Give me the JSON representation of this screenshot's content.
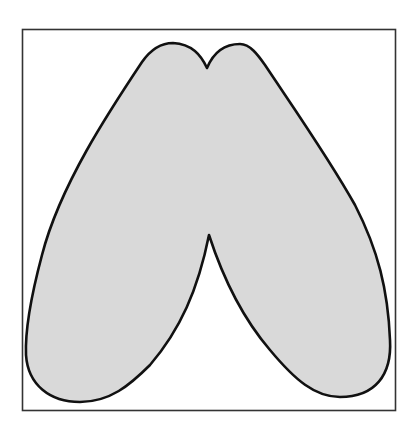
{
  "figure": {
    "colors": {
      "background": "#ffffff",
      "frame_stroke": "#333333",
      "shape_fill": "#d9d9d9",
      "shape_stroke": "#111111"
    },
    "frame": {
      "x": 22,
      "y": 29,
      "width": 374,
      "height": 382
    },
    "shape": {
      "top_notch": {
        "x": 207,
        "y": 68
      },
      "left_lobe_peak": {
        "x": 173,
        "y": 43
      },
      "right_lobe_peak": {
        "x": 240,
        "y": 44
      },
      "inner_apex": {
        "x": 209,
        "y": 235
      },
      "left_foot_bottom": {
        "x": 80,
        "y": 402
      },
      "right_foot_bottom": {
        "x": 340,
        "y": 397
      }
    }
  }
}
